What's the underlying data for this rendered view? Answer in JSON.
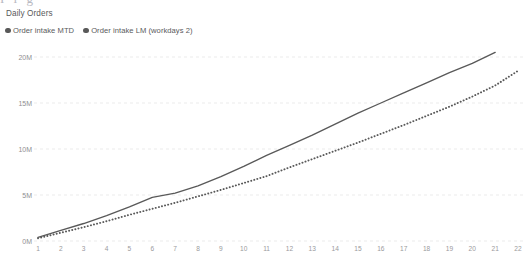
{
  "widget": {
    "title": "Daily Orders",
    "bleed_text": "I i g"
  },
  "legend": {
    "items": [
      {
        "label": "Order intake MTD",
        "color": "#595959",
        "style": "solid",
        "marker": "filled-circle"
      },
      {
        "label": "Order intake LM (workdays 2)",
        "color": "#595959",
        "style": "dotted",
        "marker": "filled-circle"
      }
    ]
  },
  "axes": {
    "y_ticks": [
      "0M",
      "5M",
      "10M",
      "15M",
      "20M"
    ],
    "x_ticks": [
      "1",
      "2",
      "3",
      "4",
      "5",
      "6",
      "7",
      "8",
      "9",
      "10",
      "11",
      "12",
      "13",
      "14",
      "15",
      "16",
      "17",
      "18",
      "19",
      "20",
      "21",
      "22"
    ],
    "gridline_color": "#e6e6e6",
    "tick_color": "#9a9a9d"
  },
  "chart_data": {
    "type": "line",
    "title": "Daily Orders",
    "xlabel": "",
    "ylabel": "",
    "xlim": [
      1,
      22
    ],
    "ylim": [
      0,
      20000000
    ],
    "ytick_values": [
      0,
      5000000,
      10000000,
      15000000,
      20000000
    ],
    "ytick_labels": [
      "0M",
      "5M",
      "10M",
      "15M",
      "20M"
    ],
    "grid": true,
    "grid_axis": "y",
    "legend_position": "top-left",
    "x": [
      1,
      2,
      3,
      4,
      5,
      6,
      7,
      8,
      9,
      10,
      11,
      12,
      13,
      14,
      15,
      16,
      17,
      18,
      19,
      20,
      21,
      22
    ],
    "series": [
      {
        "name": "Order intake MTD",
        "style": "solid",
        "color": "#595959",
        "values": [
          400000,
          1150000,
          1900000,
          2750000,
          3700000,
          4750000,
          5200000,
          6000000,
          7000000,
          8100000,
          9300000,
          10400000,
          11500000,
          12700000,
          13900000,
          15000000,
          16100000,
          17200000,
          18300000,
          19300000,
          20500000,
          null
        ]
      },
      {
        "name": "Order intake LM (workdays 2)",
        "style": "dotted",
        "color": "#595959",
        "values": [
          300000,
          900000,
          1500000,
          2150000,
          2850000,
          3500000,
          4150000,
          4850000,
          5550000,
          6300000,
          7050000,
          8000000,
          8900000,
          9800000,
          10700000,
          11650000,
          12600000,
          13600000,
          14600000,
          15700000,
          16900000,
          18500000
        ]
      }
    ]
  }
}
